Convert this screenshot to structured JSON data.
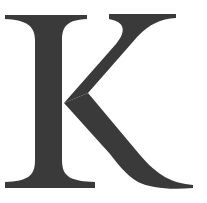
{
  "image": {
    "letter": "K",
    "description": "Large serif capital letter K",
    "colors": {
      "background": "#ffffff",
      "glyph": "#3a3a3a"
    }
  }
}
